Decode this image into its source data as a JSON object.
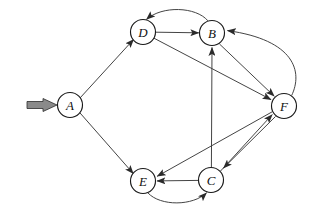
{
  "diagram": {
    "type": "directed-graph",
    "width": 310,
    "height": 210,
    "background_color": "#ffffff",
    "node_fill_color": "#ffffff",
    "node_stroke_color": "#1a1a1a",
    "edge_color": "#3a3a3a",
    "label_color": "#111111",
    "start_marker_fill": "#8a8a8a",
    "start_marker_stroke": "#2b2b2b",
    "node_radius": 12.5,
    "nodes": [
      {
        "id": "A",
        "label": "A",
        "cx": 70,
        "cy": 105
      },
      {
        "id": "B",
        "label": "B",
        "cx": 212,
        "cy": 33
      },
      {
        "id": "C",
        "label": "C",
        "cx": 211,
        "cy": 180
      },
      {
        "id": "D",
        "label": "D",
        "cx": 143,
        "cy": 32
      },
      {
        "id": "E",
        "label": "E",
        "cx": 143,
        "cy": 181
      },
      {
        "id": "F",
        "label": "F",
        "cx": 284,
        "cy": 106
      }
    ],
    "edges": [
      {
        "from": "A",
        "to": "D",
        "shape": "straight"
      },
      {
        "from": "A",
        "to": "E",
        "shape": "straight"
      },
      {
        "from": "D",
        "to": "B",
        "shape": "straight"
      },
      {
        "from": "B",
        "to": "D",
        "shape": "curved-above"
      },
      {
        "from": "D",
        "to": "F",
        "shape": "straight"
      },
      {
        "from": "B",
        "to": "F",
        "shape": "straight"
      },
      {
        "from": "F",
        "to": "B",
        "shape": "curved-right"
      },
      {
        "from": "C",
        "to": "B",
        "shape": "straight"
      },
      {
        "from": "C",
        "to": "F",
        "shape": "straight"
      },
      {
        "from": "F",
        "to": "C",
        "shape": "straight"
      },
      {
        "from": "C",
        "to": "E",
        "shape": "straight"
      },
      {
        "from": "E",
        "to": "C",
        "shape": "curved-below"
      },
      {
        "from": "F",
        "to": "E",
        "shape": "straight"
      }
    ],
    "start_marker": {
      "label": "start-arrow",
      "target": "A",
      "tail_x": 27,
      "tip_x": 56,
      "y": 105
    }
  }
}
